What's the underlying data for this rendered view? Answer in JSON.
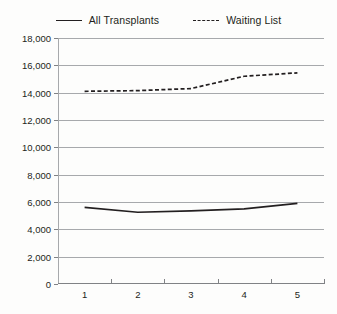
{
  "chart_data": {
    "type": "line",
    "title": "",
    "xlabel": "",
    "ylabel": "",
    "categories": [
      "1",
      "2",
      "3",
      "4",
      "5"
    ],
    "ylim": [
      0,
      18000
    ],
    "ytick_values": [
      0,
      2000,
      4000,
      6000,
      8000,
      10000,
      12000,
      14000,
      16000,
      18000
    ],
    "ytick_labels": [
      "0",
      "2,000",
      "4,000",
      "6,000",
      "8,000",
      "10,000",
      "12,000",
      "14,000",
      "16,000",
      "18,000"
    ],
    "grid": true,
    "legend_position": "top-center",
    "series": [
      {
        "name": "All Transplants",
        "style": "solid",
        "color": "#231f20",
        "values": [
          5600,
          5250,
          5350,
          5500,
          5900
        ]
      },
      {
        "name": "Waiting List",
        "style": "dashed",
        "color": "#231f20",
        "values": [
          14100,
          14150,
          14300,
          15200,
          15450
        ]
      }
    ]
  },
  "colors": {
    "ink": "#231f20",
    "grid": "#a7a9ac",
    "axis": "#808285",
    "background": "#fdfdfc"
  }
}
